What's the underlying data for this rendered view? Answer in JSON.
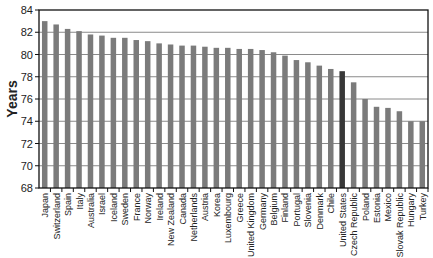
{
  "chart_data": {
    "type": "bar",
    "title": "",
    "xlabel": "",
    "ylabel": "Years",
    "ylim": [
      68,
      84
    ],
    "yticks": [
      68,
      70,
      72,
      74,
      76,
      78,
      80,
      82,
      84
    ],
    "grid": true,
    "legend": null,
    "highlight": "United States",
    "colors": {
      "bar": "#7b7b7b",
      "highlight": "#383838",
      "grid": "#8a8a8a",
      "axis": "#111111"
    },
    "categories": [
      "Japan",
      "Switzerland",
      "Spain",
      "Italy",
      "Australia",
      "Israel",
      "Iceland",
      "Sweden",
      "France",
      "Norway",
      "Ireland",
      "New Zealand",
      "Canada",
      "Netherlands",
      "Austria",
      "Korea",
      "Luxembourg",
      "Greece",
      "United Kingdom",
      "Germany",
      "Belgium",
      "Finland",
      "Portugal",
      "Slovenia",
      "Denmark",
      "Chile",
      "United States",
      "Czech Republic",
      "Poland",
      "Estonia",
      "Mexico",
      "Slovak Republic",
      "Hungary",
      "Turkey"
    ],
    "values": [
      83.0,
      82.7,
      82.3,
      82.1,
      81.8,
      81.7,
      81.5,
      81.5,
      81.3,
      81.2,
      81.0,
      80.9,
      80.8,
      80.8,
      80.7,
      80.6,
      80.6,
      80.5,
      80.5,
      80.4,
      80.2,
      79.9,
      79.5,
      79.3,
      79.0,
      78.7,
      78.5,
      77.5,
      76.0,
      75.3,
      75.2,
      74.9,
      74.0,
      74.0
    ]
  }
}
